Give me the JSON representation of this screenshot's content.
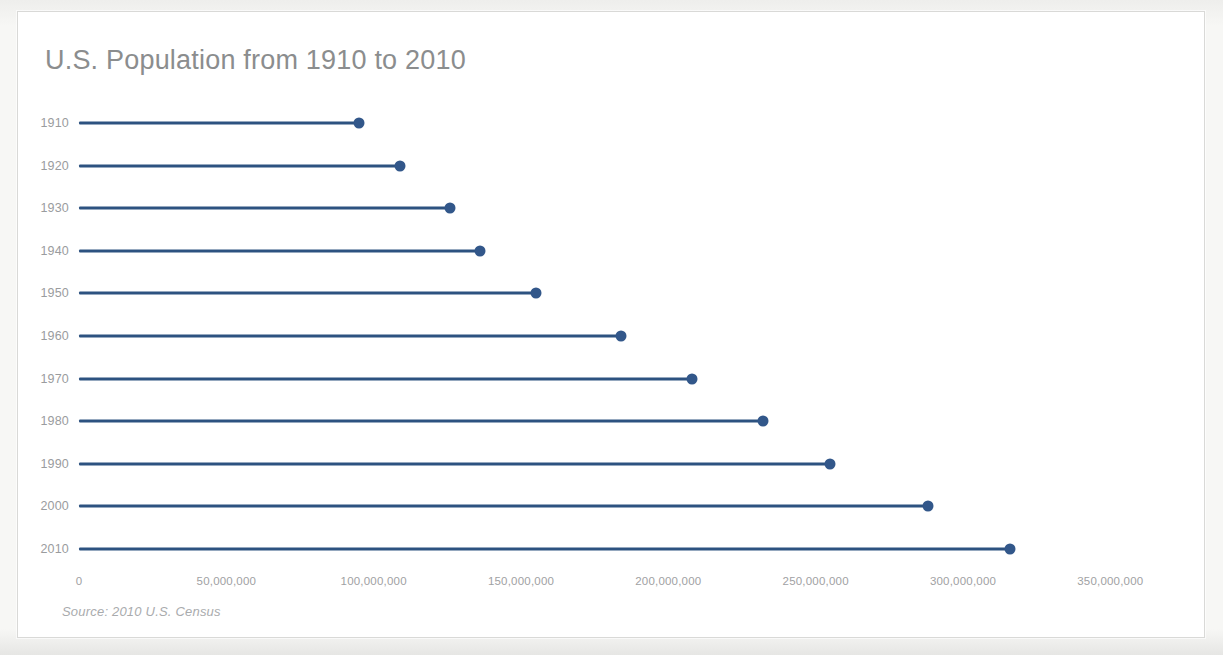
{
  "chart": {
    "title": "U.S. Population from 1910 to 2010",
    "source_note": "Source: 2010 U.S. Census"
  },
  "chart_data": {
    "type": "bar",
    "subtype": "lollipop-horizontal",
    "title": "U.S. Population from 1910 to 2010",
    "subtitle": "",
    "xlabel": "",
    "ylabel": "",
    "orientation": "horizontal",
    "grid": false,
    "legend": false,
    "legend_position": "none",
    "series_color": "#32578a",
    "categories": [
      "1910",
      "1920",
      "1930",
      "1940",
      "1950",
      "1960",
      "1970",
      "1980",
      "1990",
      "2000",
      "2010"
    ],
    "values": [
      95000000,
      109000000,
      126000000,
      136000000,
      155000000,
      184000000,
      208000000,
      232000000,
      255000000,
      288000000,
      316000000
    ],
    "xlim": [
      0,
      357000000
    ],
    "xticks": [
      0,
      50000000,
      100000000,
      150000000,
      200000000,
      250000000,
      300000000,
      350000000
    ],
    "xticklabels": [
      "0",
      "50,000,000",
      "100,000,000",
      "150,000,000",
      "200,000,000",
      "250,000,000",
      "300,000,000",
      "350,000,000"
    ],
    "yticklabels": [
      "1910",
      "1920",
      "1930",
      "1940",
      "1950",
      "1960",
      "1970",
      "1980",
      "1990",
      "2000",
      "2010"
    ]
  },
  "rows": [
    {
      "label": "1910",
      "value": 95000000
    },
    {
      "label": "1920",
      "value": 109000000
    },
    {
      "label": "1930",
      "value": 126000000
    },
    {
      "label": "1940",
      "value": 136000000
    },
    {
      "label": "1950",
      "value": 155000000
    },
    {
      "label": "1960",
      "value": 184000000
    },
    {
      "label": "1970",
      "value": 208000000
    },
    {
      "label": "1980",
      "value": 232000000
    },
    {
      "label": "1990",
      "value": 255000000
    },
    {
      "label": "2000",
      "value": 288000000
    },
    {
      "label": "2010",
      "value": 316000000
    }
  ],
  "xticks": [
    {
      "label": "0",
      "value": 0
    },
    {
      "label": "50,000,000",
      "value": 50000000
    },
    {
      "label": "100,000,000",
      "value": 100000000
    },
    {
      "label": "150,000,000",
      "value": 150000000
    },
    {
      "label": "200,000,000",
      "value": 200000000
    },
    {
      "label": "250,000,000",
      "value": 250000000
    },
    {
      "label": "300,000,000",
      "value": 300000000
    },
    {
      "label": "350,000,000",
      "value": 350000000
    }
  ]
}
